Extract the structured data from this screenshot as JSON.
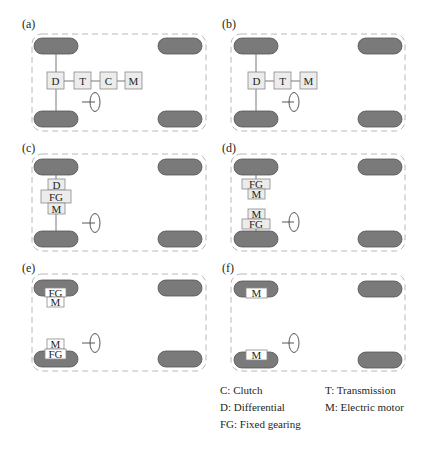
{
  "figure": {
    "panels": [
      {
        "id": "a",
        "label": "(a)",
        "components": [
          "D",
          "T",
          "C",
          "M"
        ]
      },
      {
        "id": "b",
        "label": "(b)",
        "components": [
          "D",
          "T",
          "M"
        ]
      },
      {
        "id": "c",
        "label": "(c)",
        "components": [
          "D",
          "FG",
          "M"
        ]
      },
      {
        "id": "d",
        "label": "(d)",
        "components": [
          "FG",
          "M",
          "M",
          "FG"
        ]
      },
      {
        "id": "e",
        "label": "(e)",
        "components": [
          "FG",
          "M",
          "M",
          "FG"
        ]
      },
      {
        "id": "f",
        "label": "(f)",
        "components": [
          "M",
          "M"
        ]
      }
    ],
    "legend": {
      "c": "C: Clutch",
      "d": "D: Differential",
      "fg": "FG: Fixed gearing",
      "t": "T: Transmission",
      "m": "M: Electric motor"
    }
  },
  "colors": {
    "wheel": "#7a7a7a",
    "box_fill": "#ececec",
    "chassis_dash": "#b8b8b8"
  }
}
